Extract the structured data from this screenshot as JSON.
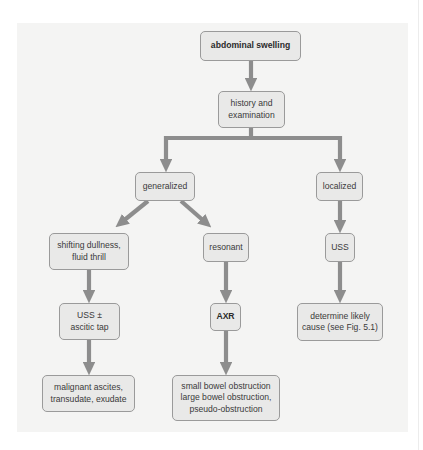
{
  "diagram": {
    "type": "flowchart",
    "colors": {
      "panel_background": "#f4f4f3",
      "node_fill": "#e9e9e8",
      "node_border": "#9a9a9a",
      "arrow": "#8d8d8d",
      "text": "#3a3a3a"
    },
    "nodes": {
      "abdominal_swelling": "abdominal swelling",
      "history": "history and\nexamination",
      "generalized": "generalized",
      "localized": "localized",
      "shifting": "shifting dullness,\nfluid thrill",
      "resonant": "resonant",
      "uss_local": "USS",
      "uss_tap": "USS ±\nascitic tap",
      "axr": "AXR",
      "determine": "determine likely\ncause (see Fig. 5.1)",
      "malignant": "malignant ascites,\ntransudate, exudate",
      "obstruction": "small bowel obstruction\nlarge bowel obstruction,\npseudo-obstruction"
    },
    "edges": [
      {
        "from": "abdominal swelling",
        "to": "history and examination"
      },
      {
        "from": "history and examination",
        "to": "generalized"
      },
      {
        "from": "history and examination",
        "to": "localized"
      },
      {
        "from": "generalized",
        "to": "shifting dullness, fluid thrill"
      },
      {
        "from": "generalized",
        "to": "resonant"
      },
      {
        "from": "localized",
        "to": "USS"
      },
      {
        "from": "shifting dullness, fluid thrill",
        "to": "USS ± ascitic tap"
      },
      {
        "from": "resonant",
        "to": "AXR"
      },
      {
        "from": "USS",
        "to": "determine likely cause (see Fig. 5.1)"
      },
      {
        "from": "USS ± ascitic tap",
        "to": "malignant ascites, transudate, exudate"
      },
      {
        "from": "AXR",
        "to": "small bowel obstruction, large bowel obstruction, pseudo-obstruction"
      }
    ]
  }
}
